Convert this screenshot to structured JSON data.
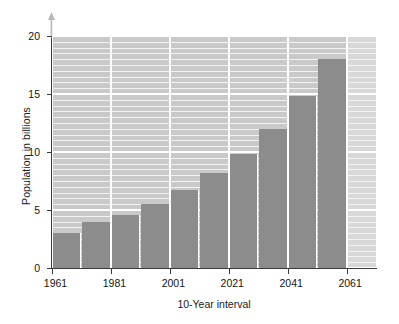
{
  "chart_data": {
    "type": "bar",
    "title": "",
    "xlabel": "10-Year interval",
    "ylabel": "Population in billions",
    "categories": [
      "1961",
      "1971",
      "1981",
      "1991",
      "2001",
      "2011",
      "2021",
      "2031",
      "2041",
      "2051",
      "2061"
    ],
    "values": [
      3.0,
      4.0,
      4.6,
      5.5,
      6.7,
      8.2,
      9.8,
      12.0,
      14.8,
      18.0,
      null
    ],
    "xtick_labels": [
      "1961",
      "1981",
      "2001",
      "2021",
      "2041",
      "2061"
    ],
    "xtick_categories": [
      "1961",
      "1981",
      "2001",
      "2021",
      "2041",
      "2061"
    ],
    "ytick_labels": [
      "0",
      "5",
      "10",
      "15",
      "20"
    ],
    "ytick_values": [
      0,
      5,
      10,
      15,
      20
    ],
    "ylim": [
      0,
      20
    ],
    "grid": true,
    "legend": null,
    "colors": {
      "bar": "#8c8c8c",
      "plot_background": "#c9c9c9",
      "plot_background_empty": "#d8d8d8",
      "gridline_major": "#ffffff",
      "gridline_minor": "#f2f2f2",
      "axis": "#3a3a3a",
      "text": "#141414",
      "page_background": "#ffffff"
    }
  },
  "axes": {
    "y_title": "Population in billions",
    "x_title": "10-Year interval",
    "y_arrow_icon": "up-arrow-icon"
  }
}
